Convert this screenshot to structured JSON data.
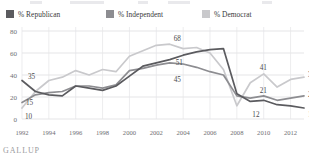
{
  "source": {
    "label": "GALLUP"
  },
  "legend": {
    "position": "top-left",
    "items": [
      {
        "label": "% Republican",
        "color": "#5b5b5f"
      },
      {
        "label": "% Independent",
        "color": "#8d8d91"
      },
      {
        "label": "% Democrat",
        "color": "#c9c9cc"
      }
    ]
  },
  "chart_data": {
    "type": "line",
    "title": "",
    "subtitle": "",
    "xlabel": "",
    "ylabel": "",
    "grid": true,
    "legend_position": "top-left",
    "xlim": [
      1992,
      2013
    ],
    "ylim": [
      0,
      80
    ],
    "yticks": [
      0,
      20,
      40,
      60,
      80
    ],
    "xticks": [
      1992,
      1994,
      1996,
      1998,
      2000,
      2002,
      2004,
      2006,
      2008,
      2010,
      2012
    ],
    "x": [
      1992,
      1993,
      1994,
      1995,
      1996,
      1997,
      1998,
      1999,
      2000,
      2001,
      2002,
      2003,
      2004,
      2005,
      2006,
      2007,
      2008,
      2009,
      2010,
      2011,
      2012,
      2013
    ],
    "series": [
      {
        "name": "% Republican",
        "color": "#5b5b5f",
        "values": [
          35,
          25,
          22,
          21,
          30,
          28,
          26,
          30,
          39,
          48,
          51,
          54,
          58,
          61,
          63,
          64,
          23,
          16,
          17,
          13,
          12,
          10
        ]
      },
      {
        "name": "% Independent",
        "color": "#8d8d91",
        "values": [
          15,
          22,
          24,
          25,
          30,
          30,
          28,
          31,
          44,
          46,
          49,
          51,
          50,
          47,
          43,
          40,
          21,
          19,
          21,
          17,
          19,
          21
        ]
      },
      {
        "name": "% Democrat",
        "color": "#c9c9cc",
        "values": [
          10,
          25,
          35,
          38,
          44,
          40,
          45,
          43,
          57,
          62,
          67,
          68,
          64,
          65,
          60,
          45,
          12,
          33,
          41,
          29,
          36,
          38
        ]
      }
    ],
    "annotations": [
      {
        "text": "35",
        "series": "% Republican",
        "x": 1992,
        "y": 35
      },
      {
        "text": "15",
        "series": "% Independent",
        "x": 1992,
        "y": 15
      },
      {
        "text": "10",
        "series": "% Democrat",
        "x": 1992,
        "y": 10
      },
      {
        "text": "68",
        "series": "% Democrat",
        "x": 2003,
        "y": 68
      },
      {
        "text": "51",
        "series": "% Independent",
        "x": 2003,
        "y": 51
      },
      {
        "text": "45",
        "series": "% Republican",
        "x": 2003,
        "y": 45
      },
      {
        "text": "41",
        "series": "% Democrat",
        "x": 2010,
        "y": 41
      },
      {
        "text": "21",
        "series": "% Independent",
        "x": 2010,
        "y": 21
      },
      {
        "text": "12",
        "series": "% Republican",
        "x": 2009,
        "y": 12
      },
      {
        "text": "38",
        "series": "% Democrat",
        "x": 2013,
        "y": 38
      },
      {
        "text": "21",
        "series": "% Independent",
        "x": 2013,
        "y": 21
      },
      {
        "text": "10",
        "series": "% Republican",
        "x": 2013,
        "y": 10
      }
    ]
  }
}
